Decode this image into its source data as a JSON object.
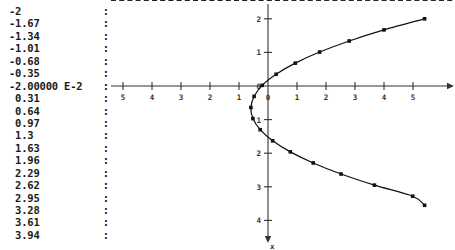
{
  "value_column": {
    "name": "value-list",
    "separator": ":",
    "values": [
      "-2",
      "-1.67",
      "-1.34",
      "-1.01",
      "-0.68",
      "-0.35",
      "-2.00000 E-2",
      " 0.31",
      " 0.64",
      " 0.97",
      " 1.3",
      " 1.63",
      " 1.96",
      " 2.29",
      " 2.62",
      " 2.95",
      " 3.28",
      " 3.61",
      " 3.94"
    ]
  },
  "chart_data": {
    "type": "scatter",
    "title": "",
    "xlabel": "x",
    "ylabel": "",
    "xlim": [
      -5.6,
      5.6
    ],
    "ylim": [
      -4.6,
      2.6
    ],
    "grid": false,
    "legend": "none",
    "x_ticks": [
      -5,
      -4,
      -3,
      -2,
      -1,
      0,
      1,
      2,
      3,
      4,
      5
    ],
    "x_tick_labels": [
      "5",
      "4",
      "3",
      "2",
      "1",
      "0",
      "1",
      "2",
      "3",
      "4",
      "5"
    ],
    "y_ticks": [
      2,
      1,
      0,
      -1,
      -2,
      -3,
      -4
    ],
    "y_tick_labels": [
      "2",
      "1",
      "0",
      "1",
      "2",
      "3",
      "4"
    ],
    "reference_line": {
      "name": "dashed-upper-bound",
      "orientation": "horizontal",
      "y": 2.55,
      "style": "dashed"
    },
    "series": [
      {
        "name": "parabola",
        "marker": "square",
        "line": "solid",
        "points": [
          [
            5.4,
            2.0
          ],
          [
            4.0,
            1.67
          ],
          [
            2.8,
            1.34
          ],
          [
            1.78,
            1.01
          ],
          [
            0.94,
            0.68
          ],
          [
            0.28,
            0.35
          ],
          [
            -0.2,
            0.02
          ],
          [
            -0.48,
            -0.31
          ],
          [
            -0.59,
            -0.64
          ],
          [
            -0.52,
            -0.97
          ],
          [
            -0.27,
            -1.3
          ],
          [
            0.16,
            -1.63
          ],
          [
            0.77,
            -1.96
          ],
          [
            1.56,
            -2.29
          ],
          [
            2.52,
            -2.62
          ],
          [
            3.67,
            -2.95
          ],
          [
            4.99,
            -3.28
          ],
          [
            5.4,
            -3.55
          ]
        ]
      }
    ]
  },
  "axis_arrows": {
    "x_axis_arrow": "right",
    "y_axis_arrow": "down",
    "y_axis_bottom_label": "x"
  }
}
